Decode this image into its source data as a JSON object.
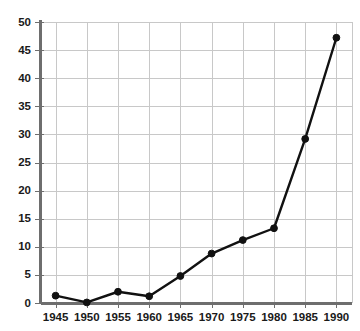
{
  "chart_data": {
    "type": "line",
    "title": "",
    "subtitle": "",
    "xlabel": "",
    "ylabel": "",
    "x": [
      1945,
      1950,
      1955,
      1960,
      1965,
      1970,
      1975,
      1980,
      1985,
      1990
    ],
    "categories": [
      "1945",
      "1950",
      "1955",
      "1960",
      "1965",
      "1970",
      "1975",
      "1980",
      "1985",
      "1990"
    ],
    "values": [
      1.3,
      0.1,
      2.0,
      1.2,
      4.8,
      8.8,
      11.2,
      13.3,
      29.2,
      47.2
    ],
    "series": [
      {
        "name": "",
        "values": [
          1.3,
          0.1,
          2.0,
          1.2,
          4.8,
          8.8,
          11.2,
          13.3,
          29.2,
          47.2
        ]
      }
    ],
    "xlim": [
      1942.5,
      1992.5
    ],
    "ylim": [
      0,
      50
    ],
    "ytick_labels": [
      "0",
      "5",
      "10",
      "15",
      "20",
      "25",
      "30",
      "35",
      "40",
      "45",
      "50"
    ],
    "ytick_values": [
      0,
      5,
      10,
      15,
      20,
      25,
      30,
      35,
      40,
      45,
      50
    ],
    "xtick_labels": [
      "1945",
      "1950",
      "1955",
      "1960",
      "1965",
      "1970",
      "1975",
      "1980",
      "1985",
      "1990"
    ],
    "xtick_values": [
      1945,
      1950,
      1955,
      1960,
      1965,
      1970,
      1975,
      1980,
      1985,
      1990
    ],
    "grid": true,
    "grid_color": "#c8c8c8",
    "legend": false,
    "legend_position": "none",
    "line_color": "#111111",
    "marker": "circle",
    "marker_color": "#111111",
    "background_color": "#ffffff",
    "axis_color": "#6e6e6e",
    "annotations": []
  }
}
